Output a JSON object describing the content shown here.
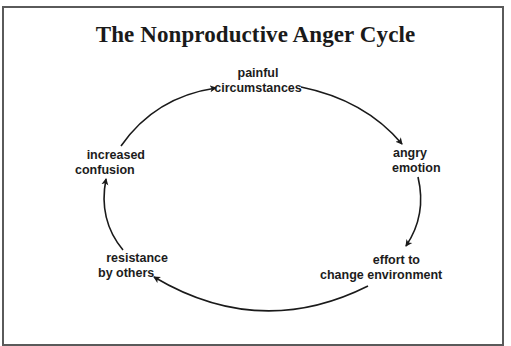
{
  "diagram": {
    "title": "The Nonproductive Anger Cycle",
    "type": "cycle",
    "direction": "clockwise",
    "colors": {
      "text": "#1a1a1a",
      "arrow": "#1a1a1a",
      "frame": "#5a5a5a",
      "background": "#ffffff"
    },
    "nodes": [
      {
        "id": "painful",
        "line1": "painful",
        "line2": "circumstances"
      },
      {
        "id": "angry",
        "line1": "angry",
        "line2": "emotion"
      },
      {
        "id": "effort",
        "line1": "effort to",
        "line2": "change environment"
      },
      {
        "id": "resistance",
        "line1": "resistance",
        "line2": "by others"
      },
      {
        "id": "confusion",
        "line1": "increased",
        "line2": "confusion"
      }
    ],
    "edges": [
      {
        "from": "painful",
        "to": "angry"
      },
      {
        "from": "angry",
        "to": "effort"
      },
      {
        "from": "effort",
        "to": "resistance"
      },
      {
        "from": "resistance",
        "to": "confusion"
      },
      {
        "from": "confusion",
        "to": "painful"
      }
    ]
  }
}
